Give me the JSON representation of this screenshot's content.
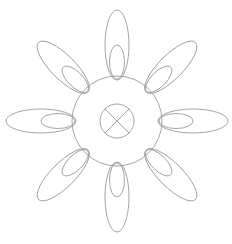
{
  "diagram": {
    "title": "",
    "line_color": "#9a9a9a",
    "background": "#ffffff",
    "hub": {
      "symbol": "circle-with-x"
    },
    "petals": {
      "count": 8,
      "angles_deg": [
        0,
        45,
        90,
        135,
        180,
        225,
        270,
        315
      ],
      "layers": [
        "outer-ellipse",
        "inner-ellipse"
      ]
    }
  }
}
